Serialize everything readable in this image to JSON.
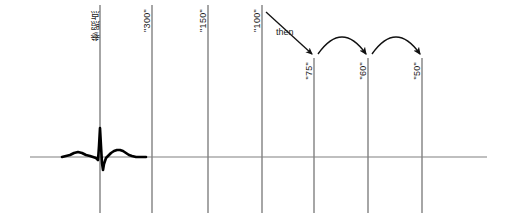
{
  "figure": {
    "type": "annotated-waveform-timeline",
    "background_color": "#ffffff",
    "axis_color": "#808080",
    "trace_color": "#000000",
    "annotation_color": "#1a1a1a"
  },
  "baseline": {
    "name": "horizontal-baseline",
    "x_start": 30,
    "x_end": 487,
    "y": 157
  },
  "markers": [
    {
      "id": "reference-point",
      "label": "参照点",
      "x": 100,
      "line_top": 5,
      "line_bottom": 213,
      "label_x": 91,
      "label_y": 9,
      "cjk": true
    },
    {
      "id": "marker-300",
      "label": "\"300\"",
      "x": 152,
      "line_top": 5,
      "line_bottom": 213,
      "label_x": 143,
      "label_y": 9,
      "cjk": false
    },
    {
      "id": "marker-150",
      "label": "\"150\"",
      "x": 208,
      "line_top": 5,
      "line_bottom": 213,
      "label_x": 199,
      "label_y": 9,
      "cjk": false
    },
    {
      "id": "marker-100",
      "label": "\"100\"",
      "x": 262,
      "line_top": 5,
      "line_bottom": 213,
      "label_x": 253,
      "label_y": 9,
      "cjk": false
    },
    {
      "id": "marker-75",
      "label": "\"75\"",
      "x": 314,
      "line_top": 58,
      "line_bottom": 213,
      "label_x": 305,
      "label_y": 62,
      "cjk": false
    },
    {
      "id": "marker-60",
      "label": "\"60\"",
      "x": 368,
      "line_top": 58,
      "line_bottom": 213,
      "label_x": 359,
      "label_y": 62,
      "cjk": false
    },
    {
      "id": "marker-50",
      "label": "\"50\"",
      "x": 422,
      "line_top": 58,
      "line_bottom": 213,
      "label_x": 413,
      "label_y": 62,
      "cjk": false
    }
  ],
  "annotations": {
    "then_label": "then",
    "then_label_x": 276,
    "then_label_y": 27,
    "straight_arrow": {
      "name": "then-arrow",
      "from_x": 266,
      "from_y": 12,
      "to_x": 312,
      "to_y": 54
    },
    "curved_arrows": [
      {
        "name": "arc-75-to-60",
        "from_x": 318,
        "from_y": 54,
        "ctrl_x": 342,
        "ctrl_y": 20,
        "to_x": 366,
        "to_y": 54
      },
      {
        "name": "arc-60-to-50",
        "from_x": 372,
        "from_y": 54,
        "ctrl_x": 396,
        "ctrl_y": 20,
        "to_x": 420,
        "to_y": 54
      }
    ]
  },
  "waveform": {
    "name": "ecg-trace",
    "baseline_y": 157,
    "description": "ECG complex with P wave, QRS spike and T wave near the reference point",
    "points": [
      [
        62,
        157
      ],
      [
        66,
        156
      ],
      [
        70,
        155
      ],
      [
        74,
        153
      ],
      [
        78,
        152
      ],
      [
        82,
        153
      ],
      [
        86,
        155
      ],
      [
        90,
        156
      ],
      [
        93,
        157
      ],
      [
        96,
        158
      ],
      [
        98,
        160
      ],
      [
        99,
        146
      ],
      [
        100,
        128
      ],
      [
        101,
        146
      ],
      [
        102,
        163
      ],
      [
        103,
        170
      ],
      [
        104,
        164
      ],
      [
        106,
        158
      ],
      [
        108,
        156
      ],
      [
        111,
        153
      ],
      [
        114,
        151
      ],
      [
        117,
        150
      ],
      [
        120,
        150
      ],
      [
        123,
        151
      ],
      [
        126,
        153
      ],
      [
        129,
        155
      ],
      [
        132,
        156
      ],
      [
        136,
        157
      ],
      [
        140,
        157
      ],
      [
        146,
        157
      ]
    ]
  }
}
